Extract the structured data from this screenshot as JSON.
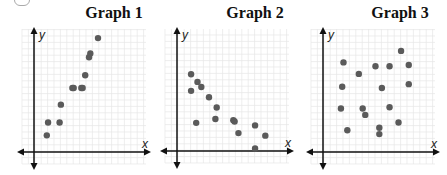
{
  "chart_data": [
    {
      "type": "scatter",
      "title": "Graph 1",
      "xlabel": "x",
      "ylabel": "y",
      "grid": true,
      "origin_px": [
        34,
        152
      ],
      "unit_px": 12.8,
      "points": [
        [
          1,
          1.3
        ],
        [
          1.1,
          2.3
        ],
        [
          2,
          2.3
        ],
        [
          2.1,
          3.7
        ],
        [
          3,
          5
        ],
        [
          3.1,
          5
        ],
        [
          3.7,
          5
        ],
        [
          3.8,
          5
        ],
        [
          4,
          6
        ],
        [
          4.3,
          7.4
        ],
        [
          4.4,
          7.7
        ],
        [
          5,
          8.9
        ]
      ]
    },
    {
      "type": "scatter",
      "title": "Graph 2",
      "xlabel": "x",
      "ylabel": "y",
      "grid": true,
      "origin_px": [
        177,
        151
      ],
      "unit_px": 12.8,
      "points": [
        [
          1.1,
          6
        ],
        [
          1.1,
          4.7
        ],
        [
          1.6,
          5.4
        ],
        [
          1.9,
          5
        ],
        [
          2.5,
          4.2
        ],
        [
          3.1,
          3.4
        ],
        [
          1.5,
          2.2
        ],
        [
          3,
          2.5
        ],
        [
          4.4,
          2.4
        ],
        [
          4.5,
          2.3
        ],
        [
          4.8,
          1.4
        ],
        [
          6.1,
          2
        ],
        [
          6.9,
          1.2
        ],
        [
          6.1,
          0.2
        ]
      ]
    },
    {
      "type": "scatter",
      "title": "Graph 3",
      "xlabel": "x",
      "ylabel": "y",
      "grid": true,
      "origin_px": [
        323,
        152
      ],
      "unit_px": 12.8,
      "points": [
        [
          1.6,
          7
        ],
        [
          1.5,
          5.1
        ],
        [
          1.4,
          3.4
        ],
        [
          1.9,
          1.7
        ],
        [
          2.8,
          6.1
        ],
        [
          3.1,
          3.4
        ],
        [
          3.3,
          2.9
        ],
        [
          4.1,
          6.7
        ],
        [
          4.6,
          5
        ],
        [
          4.4,
          1.9
        ],
        [
          4.4,
          1.4
        ],
        [
          5.2,
          6.7
        ],
        [
          5.2,
          3.5
        ],
        [
          5.9,
          2.3
        ],
        [
          6.1,
          7.9
        ],
        [
          6.7,
          6.8
        ],
        [
          6.7,
          5.3
        ]
      ]
    }
  ],
  "titles": [
    "Graph 1",
    "Graph 2",
    "Graph 3"
  ],
  "axis_labels": {
    "x": "x",
    "y": "y"
  },
  "colors": {
    "point": "#5a5a5a",
    "axis": "#111111",
    "grid": "#e6e6e6"
  }
}
